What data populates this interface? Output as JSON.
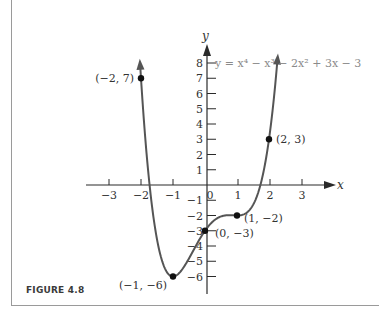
{
  "figure": {
    "label": "FIGURE 4.8"
  },
  "chart_data": {
    "type": "line",
    "title": "",
    "equation": "y = x⁴ − x³ − 2x² + 3x − 3",
    "xlabel": "x",
    "ylabel": "y",
    "xlim": [
      -3,
      3
    ],
    "ylim": [
      -6,
      8
    ],
    "grid": false,
    "x_ticks": [
      {
        "value": -3,
        "label": "−3"
      },
      {
        "value": -2,
        "label": "−2"
      },
      {
        "value": -1,
        "label": "−1"
      },
      {
        "value": 0,
        "label": "0"
      },
      {
        "value": 1,
        "label": "1"
      },
      {
        "value": 2,
        "label": "2"
      },
      {
        "value": 3,
        "label": "3"
      }
    ],
    "y_ticks": [
      {
        "value": 8,
        "label": "8"
      },
      {
        "value": 7,
        "label": "7"
      },
      {
        "value": 6,
        "label": "6"
      },
      {
        "value": 5,
        "label": "5"
      },
      {
        "value": 4,
        "label": "4"
      },
      {
        "value": 3,
        "label": "3"
      },
      {
        "value": 2,
        "label": "2"
      },
      {
        "value": 1,
        "label": "1"
      },
      {
        "value": -1,
        "label": "−1"
      },
      {
        "value": -2,
        "label": "−2"
      },
      {
        "value": -3,
        "label": "−3"
      },
      {
        "value": -4,
        "label": "−4"
      },
      {
        "value": -5,
        "label": "−5"
      },
      {
        "value": -6,
        "label": "−6"
      }
    ],
    "series": [
      {
        "name": "y = x⁴ − x³ − 2x² + 3x − 3",
        "x": [
          -2.0,
          -1.9,
          -1.8,
          -1.7,
          -1.6,
          -1.5,
          -1.4,
          -1.3,
          -1.2,
          -1.1,
          -1.0,
          -0.9,
          -0.8,
          -0.7,
          -0.6,
          -0.5,
          -0.4,
          -0.3,
          -0.2,
          -0.1,
          0.0,
          0.2,
          0.4,
          0.6,
          0.8,
          1.0,
          1.2,
          1.4,
          1.6,
          1.8,
          2.0,
          2.2
        ],
        "y": [
          7.0,
          3.971,
          1.45,
          -0.615,
          -2.27,
          -3.563,
          -4.534,
          -5.227,
          -5.678,
          -5.925,
          -6.0,
          -5.935,
          -5.758,
          -5.497,
          -5.174,
          -4.813,
          -4.43,
          -4.045,
          -3.67,
          -3.319,
          -3.0,
          -2.486,
          -2.158,
          -2.006,
          -1.982,
          -2.0,
          -1.934,
          -1.622,
          -0.862,
          0.586,
          3.0,
          6.698
        ],
        "color": "#555555",
        "arrow_ends": true
      }
    ],
    "labeled_points": [
      {
        "x": -2,
        "y": 7,
        "label": "(−2, 7)"
      },
      {
        "x": 2,
        "y": 3,
        "label": "(2, 3)"
      },
      {
        "x": 1,
        "y": -2,
        "label": "(1, −2)"
      },
      {
        "x": 0,
        "y": -3,
        "label": "(0, −3)"
      },
      {
        "x": -1,
        "y": -6,
        "label": "(−1, −6)"
      }
    ],
    "colors": {
      "curve": "#555555",
      "axes": "#2a2a2a",
      "points": "#111111",
      "equation_text": "#8a8a8a"
    }
  }
}
